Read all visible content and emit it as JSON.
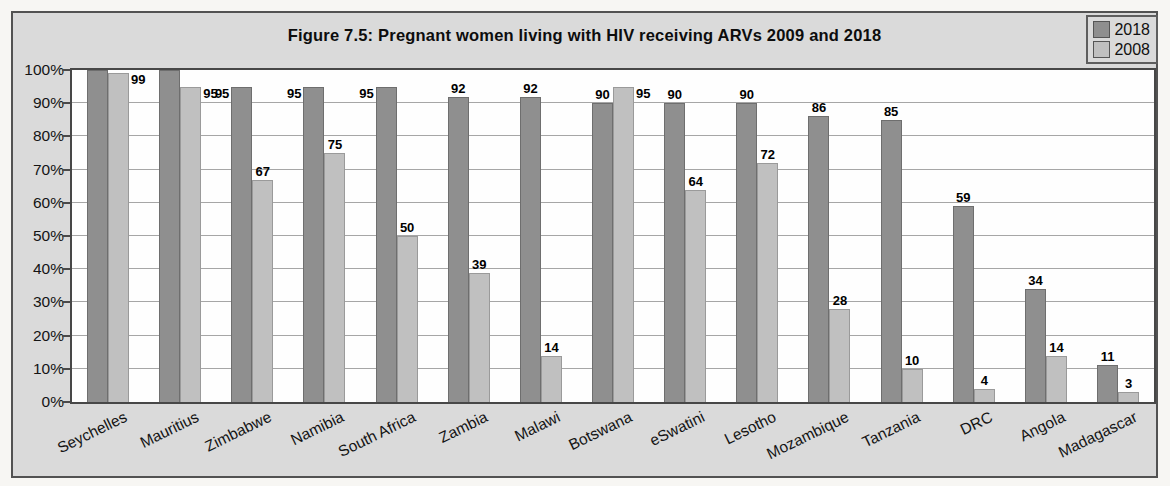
{
  "chart_data": {
    "type": "bar",
    "title": "Figure 7.5: Pregnant women living with HIV receiving ARVs 2009 and 2018",
    "xlabel": "",
    "ylabel": "",
    "ylim": [
      0,
      100
    ],
    "grid": true,
    "legend_position": "top-right",
    "ytick_labels": [
      "0%",
      "10%",
      "20%",
      "30%",
      "40%",
      "50%",
      "60%",
      "70%",
      "80%",
      "90%",
      "100%"
    ],
    "categories": [
      "Seychelles",
      "Mauritius",
      "Zimbabwe",
      "Namibia",
      "South Africa",
      "Zambia",
      "Malawi",
      "Botswana",
      "eSwatini",
      "Lesotho",
      "Mozambique",
      "Tanzania",
      "DRC",
      "Angola",
      "Madagascar"
    ],
    "series": [
      {
        "name": "2018",
        "color": "#8f8f8f",
        "border_color": "#6e6e6e",
        "values": [
          100,
          100,
          95,
          95,
          95,
          92,
          92,
          90,
          90,
          90,
          86,
          85,
          59,
          34,
          11
        ],
        "data_labels": [
          "",
          "",
          "95",
          "95",
          "95",
          "92",
          "92",
          "90",
          "90",
          "90",
          "86",
          "85",
          "59",
          "34",
          "11"
        ],
        "label_positions": [
          "none",
          "none",
          "left",
          "left",
          "left",
          "above",
          "above",
          "above",
          "above",
          "above",
          "above",
          "above",
          "above",
          "above",
          "above"
        ]
      },
      {
        "name": "2008",
        "color": "#c0c0c0",
        "border_color": "#9a9a9a",
        "values": [
          99,
          95,
          67,
          75,
          50,
          39,
          14,
          95,
          64,
          72,
          28,
          10,
          4,
          14,
          3
        ],
        "data_labels": [
          "99",
          "95",
          "67",
          "75",
          "50",
          "39",
          "14",
          "95",
          "64",
          "72",
          "28",
          "10",
          "4",
          "14",
          "3"
        ],
        "label_positions": [
          "right",
          "right",
          "above",
          "above",
          "above",
          "above",
          "above",
          "right",
          "above",
          "above",
          "above",
          "above",
          "above",
          "above",
          "above"
        ]
      }
    ]
  }
}
